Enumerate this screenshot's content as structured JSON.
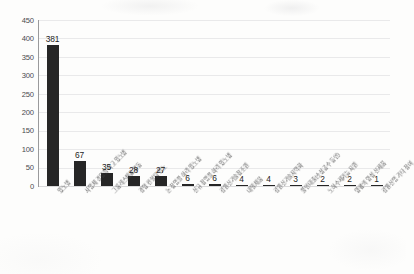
{
  "chart_data": {
    "type": "bar",
    "title": "",
    "subtitle": "",
    "xlabel": "",
    "ylabel": "",
    "ylim": [
      0,
      450
    ],
    "ytick_step": 50,
    "yticks": [
      450,
      400,
      350,
      300,
      250,
      200,
      150,
      100,
      50,
      0
    ],
    "grid": true,
    "legend": false,
    "bar_color": "#262626",
    "gridline_color": "#e9e9ea",
    "axis_color": "#9a9a9c",
    "categories": [
      "있노병",
      "사업체 경영을 하고 있노병",
      "그룹레스채를 활동",
      "경영 컨설팅 있노",
      "논 창업을 하려 있노병",
      "신규 창업을 하려 있노병",
      "강원신기술창조원",
      "내일채움",
      "강원신기술지역화",
      "울인대출(소상공수 등인)",
      "노하수제기능 지원",
      "양평의 양성 신제품",
      "강원신업 기타 참여"
    ],
    "values": [
      381,
      67,
      35,
      28,
      27,
      6,
      6,
      4,
      4,
      3,
      2,
      2,
      1
    ],
    "value_labels": [
      "381",
      "67",
      "35",
      "28",
      "27",
      "6",
      "6",
      "4",
      "4",
      "3",
      "2",
      "2",
      "1"
    ]
  }
}
